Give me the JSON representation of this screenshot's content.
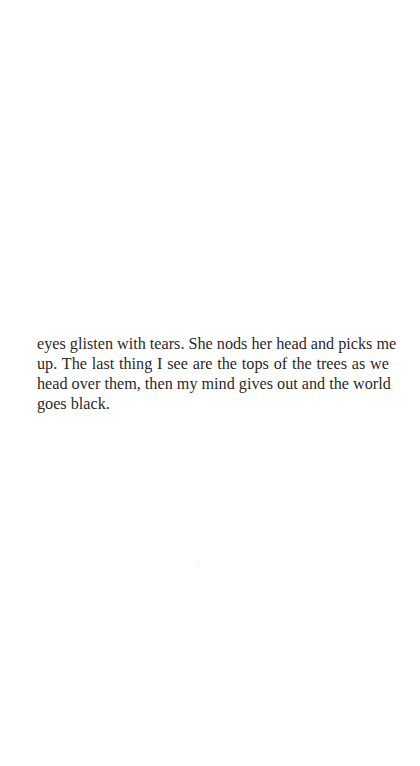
{
  "page": {
    "background": "#ffffff",
    "text_color": "#2a2a2a"
  },
  "content": {
    "paragraph": "eyes glisten with tears. She nods her head and picks me up. The last thing I see are the tops of the trees as we head over them, then my mind gives out and the world goes black.",
    "lines": [
      "eyes glisten with tears. She nods her head and picks me",
      "up. The last thing I see are the tops of the trees as we",
      "head over them, then my mind gives out and the world",
      "goes black."
    ]
  }
}
